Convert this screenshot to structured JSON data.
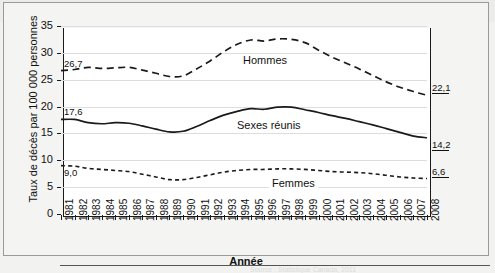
{
  "figure": {
    "watermark_text": "SantéPublique",
    "axis_x_title": "Année",
    "axis_y_title": "Taux de décès par 100 000 personnes",
    "source_ghost": "Source : Statistique Canada, 2011"
  },
  "yticks": [
    "0",
    "5",
    "10",
    "15",
    "20",
    "25",
    "30",
    "35"
  ],
  "series_labels": {
    "hommes": "Hommes",
    "sexes_reunis": "Sexes réunis",
    "femmes": "Femmes"
  },
  "start_labels": {
    "hommes": "26,7",
    "sexes_reunis": "17,6",
    "femmes": "9,0"
  },
  "end_labels": {
    "hommes": "22,1",
    "sexes_reunis": "14,2",
    "femmes": "6,6"
  },
  "chart_data": {
    "type": "line",
    "title": "",
    "xlabel": "Année",
    "ylabel": "Taux de décès par 100 000 personnes",
    "ylim": [
      0,
      35
    ],
    "yticks": [
      0,
      5,
      10,
      15,
      20,
      25,
      30,
      35
    ],
    "grid": true,
    "legend": "inline-labels",
    "categories": [
      "1981",
      "1982",
      "1983",
      "1984",
      "1985",
      "1986",
      "1987",
      "1988",
      "1989",
      "1990",
      "1991",
      "1992",
      "1993",
      "1994",
      "1995",
      "1996",
      "1997",
      "1998",
      "1999",
      "2000",
      "2001",
      "2002",
      "2003",
      "2004",
      "2005",
      "2006",
      "2007",
      "2008"
    ],
    "series": [
      {
        "name": "Hommes",
        "style": "long-dashed",
        "values": [
          26.7,
          26.9,
          27.3,
          27.1,
          27.2,
          27.3,
          26.8,
          26.2,
          25.6,
          25.7,
          27.0,
          28.5,
          30.2,
          31.6,
          32.4,
          32.2,
          32.6,
          32.5,
          31.9,
          30.5,
          29.2,
          28.1,
          27.0,
          25.8,
          24.6,
          23.6,
          22.8,
          22.1
        ]
      },
      {
        "name": "Sexes réunis",
        "style": "solid",
        "values": [
          17.6,
          17.6,
          17.0,
          16.8,
          17.0,
          16.9,
          16.4,
          15.8,
          15.3,
          15.4,
          16.3,
          17.4,
          18.4,
          19.1,
          19.6,
          19.5,
          19.9,
          19.9,
          19.4,
          18.9,
          18.3,
          17.8,
          17.2,
          16.6,
          15.9,
          15.2,
          14.5,
          14.2
        ]
      },
      {
        "name": "Femmes",
        "style": "short-dashed",
        "values": [
          9.0,
          8.9,
          8.5,
          8.3,
          8.1,
          7.9,
          7.4,
          6.9,
          6.4,
          6.4,
          6.8,
          7.3,
          7.8,
          8.1,
          8.3,
          8.3,
          8.4,
          8.4,
          8.3,
          8.1,
          7.9,
          7.8,
          7.7,
          7.5,
          7.2,
          6.9,
          6.7,
          6.6
        ]
      }
    ]
  }
}
